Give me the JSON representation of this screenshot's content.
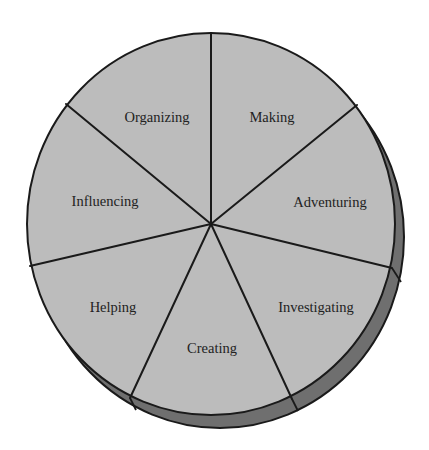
{
  "diagram": {
    "type": "pie-wheel",
    "colors": {
      "face": "#bcbcbc",
      "rim": "#6f6f6f",
      "outline": "#1a1a1a",
      "label": "#222222",
      "background": "#ffffff"
    },
    "segments": [
      {
        "label": "Organizing"
      },
      {
        "label": "Making"
      },
      {
        "label": "Adventuring"
      },
      {
        "label": "Investigating"
      },
      {
        "label": "Creating"
      },
      {
        "label": "Helping"
      },
      {
        "label": "Influencing"
      }
    ]
  }
}
